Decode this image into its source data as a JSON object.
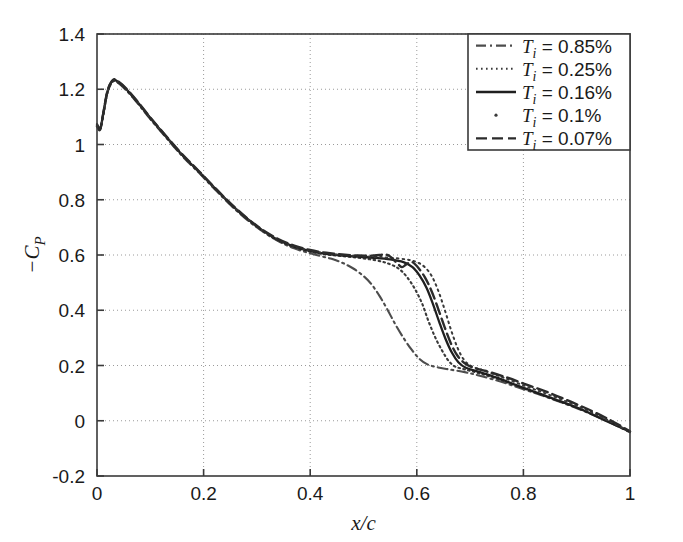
{
  "chart_data": {
    "type": "line",
    "title": "",
    "xlabel": "x/c",
    "ylabel": "-C_P",
    "xlim": [
      0,
      1
    ],
    "ylim": [
      -0.2,
      1.4
    ],
    "xticks": [
      "0",
      "0.2",
      "0.4",
      "0.6",
      "0.8",
      "1"
    ],
    "xtick_values": [
      0,
      0.2,
      0.4,
      0.6,
      0.8,
      1
    ],
    "yticks": [
      "1.4",
      "1.2",
      "1",
      "0.8",
      "0.6",
      "0.4",
      "0.2",
      "0",
      "-0.2"
    ],
    "ytick_values": [
      1.4,
      1.2,
      1.0,
      0.8,
      0.6,
      0.4,
      0.2,
      0,
      -0.2
    ],
    "grid": true,
    "grid_style": "dotted",
    "legend_position": "top-right",
    "series": [
      {
        "name": "Ti = 0.85%",
        "label_var": "T",
        "label_sub": "i",
        "label_value": "= 0.85%",
        "style": "dashdot",
        "color": "#4d4d4d",
        "points": [
          [
            0.0,
            1.075
          ],
          [
            0.006,
            1.06
          ],
          [
            0.012,
            1.11
          ],
          [
            0.02,
            1.19
          ],
          [
            0.03,
            1.228
          ],
          [
            0.04,
            1.222
          ],
          [
            0.055,
            1.196
          ],
          [
            0.075,
            1.152
          ],
          [
            0.1,
            1.092
          ],
          [
            0.13,
            1.024
          ],
          [
            0.16,
            0.958
          ],
          [
            0.19,
            0.9
          ],
          [
            0.22,
            0.84
          ],
          [
            0.25,
            0.782
          ],
          [
            0.28,
            0.73
          ],
          [
            0.31,
            0.686
          ],
          [
            0.34,
            0.65
          ],
          [
            0.37,
            0.624
          ],
          [
            0.4,
            0.606
          ],
          [
            0.42,
            0.596
          ],
          [
            0.44,
            0.586
          ],
          [
            0.46,
            0.572
          ],
          [
            0.48,
            0.552
          ],
          [
            0.5,
            0.524
          ],
          [
            0.515,
            0.494
          ],
          [
            0.53,
            0.452
          ],
          [
            0.545,
            0.402
          ],
          [
            0.56,
            0.348
          ],
          [
            0.575,
            0.3
          ],
          [
            0.59,
            0.258
          ],
          [
            0.605,
            0.224
          ],
          [
            0.62,
            0.204
          ],
          [
            0.64,
            0.193
          ],
          [
            0.66,
            0.186
          ],
          [
            0.69,
            0.176
          ],
          [
            0.72,
            0.162
          ],
          [
            0.76,
            0.14
          ],
          [
            0.8,
            0.114
          ],
          [
            0.84,
            0.088
          ],
          [
            0.88,
            0.06
          ],
          [
            0.92,
            0.03
          ],
          [
            0.96,
            -0.004
          ],
          [
            1.0,
            -0.042
          ]
        ]
      },
      {
        "name": "Ti = 0.25%",
        "label_var": "T",
        "label_sub": "i",
        "label_value": "= 0.25%",
        "style": "dotted",
        "color": "#3a3a3a",
        "points": [
          [
            0.0,
            1.072
          ],
          [
            0.006,
            1.058
          ],
          [
            0.012,
            1.112
          ],
          [
            0.02,
            1.192
          ],
          [
            0.03,
            1.23
          ],
          [
            0.04,
            1.224
          ],
          [
            0.055,
            1.198
          ],
          [
            0.075,
            1.154
          ],
          [
            0.1,
            1.094
          ],
          [
            0.13,
            1.026
          ],
          [
            0.16,
            0.96
          ],
          [
            0.19,
            0.902
          ],
          [
            0.22,
            0.842
          ],
          [
            0.25,
            0.784
          ],
          [
            0.28,
            0.732
          ],
          [
            0.31,
            0.688
          ],
          [
            0.34,
            0.652
          ],
          [
            0.37,
            0.628
          ],
          [
            0.4,
            0.612
          ],
          [
            0.43,
            0.602
          ],
          [
            0.46,
            0.596
          ],
          [
            0.49,
            0.59
          ],
          [
            0.52,
            0.582
          ],
          [
            0.545,
            0.57
          ],
          [
            0.565,
            0.552
          ],
          [
            0.58,
            0.524
          ],
          [
            0.595,
            0.482
          ],
          [
            0.61,
            0.424
          ],
          [
            0.622,
            0.36
          ],
          [
            0.635,
            0.3
          ],
          [
            0.648,
            0.252
          ],
          [
            0.66,
            0.216
          ],
          [
            0.672,
            0.196
          ],
          [
            0.69,
            0.186
          ],
          [
            0.72,
            0.17
          ],
          [
            0.76,
            0.146
          ],
          [
            0.8,
            0.118
          ],
          [
            0.84,
            0.09
          ],
          [
            0.88,
            0.062
          ],
          [
            0.92,
            0.032
          ],
          [
            0.96,
            -0.002
          ],
          [
            1.0,
            -0.04
          ]
        ]
      },
      {
        "name": "Ti = 0.16%",
        "label_var": "T",
        "label_sub": "i",
        "label_value": "= 0.16%",
        "style": "solid",
        "color": "#1f1f1f",
        "points": [
          [
            0.0,
            1.07
          ],
          [
            0.006,
            1.056
          ],
          [
            0.012,
            1.114
          ],
          [
            0.02,
            1.194
          ],
          [
            0.03,
            1.232
          ],
          [
            0.04,
            1.226
          ],
          [
            0.055,
            1.2
          ],
          [
            0.075,
            1.156
          ],
          [
            0.1,
            1.096
          ],
          [
            0.13,
            1.028
          ],
          [
            0.16,
            0.962
          ],
          [
            0.19,
            0.904
          ],
          [
            0.22,
            0.844
          ],
          [
            0.25,
            0.786
          ],
          [
            0.28,
            0.734
          ],
          [
            0.31,
            0.69
          ],
          [
            0.34,
            0.654
          ],
          [
            0.37,
            0.63
          ],
          [
            0.4,
            0.614
          ],
          [
            0.43,
            0.604
          ],
          [
            0.46,
            0.598
          ],
          [
            0.49,
            0.594
          ],
          [
            0.52,
            0.59
          ],
          [
            0.55,
            0.584
          ],
          [
            0.575,
            0.574
          ],
          [
            0.592,
            0.556
          ],
          [
            0.605,
            0.526
          ],
          [
            0.618,
            0.482
          ],
          [
            0.63,
            0.424
          ],
          [
            0.642,
            0.358
          ],
          [
            0.654,
            0.296
          ],
          [
            0.666,
            0.246
          ],
          [
            0.678,
            0.212
          ],
          [
            0.692,
            0.192
          ],
          [
            0.715,
            0.178
          ],
          [
            0.75,
            0.156
          ],
          [
            0.79,
            0.126
          ],
          [
            0.83,
            0.098
          ],
          [
            0.87,
            0.07
          ],
          [
            0.91,
            0.04
          ],
          [
            0.95,
            0.004
          ],
          [
            1.0,
            -0.04
          ]
        ]
      },
      {
        "name": "Ti = 0.1%",
        "label_var": "T",
        "label_sub": "i",
        "label_value": "= 0.1%",
        "style": "dot",
        "color": "#3a3a3a",
        "points": [
          [
            0.0,
            1.068
          ],
          [
            0.006,
            1.056
          ],
          [
            0.012,
            1.114
          ],
          [
            0.02,
            1.194
          ],
          [
            0.03,
            1.232
          ],
          [
            0.04,
            1.226
          ],
          [
            0.055,
            1.2
          ],
          [
            0.075,
            1.156
          ],
          [
            0.1,
            1.096
          ],
          [
            0.13,
            1.028
          ],
          [
            0.16,
            0.962
          ],
          [
            0.19,
            0.904
          ],
          [
            0.22,
            0.844
          ],
          [
            0.25,
            0.786
          ],
          [
            0.28,
            0.734
          ],
          [
            0.31,
            0.69
          ],
          [
            0.34,
            0.656
          ],
          [
            0.37,
            0.632
          ],
          [
            0.4,
            0.616
          ],
          [
            0.43,
            0.606
          ],
          [
            0.46,
            0.6
          ],
          [
            0.49,
            0.596
          ],
          [
            0.52,
            0.594
          ],
          [
            0.55,
            0.59
          ],
          [
            0.58,
            0.584
          ],
          [
            0.6,
            0.574
          ],
          [
            0.615,
            0.556
          ],
          [
            0.628,
            0.524
          ],
          [
            0.64,
            0.472
          ],
          [
            0.652,
            0.404
          ],
          [
            0.664,
            0.33
          ],
          [
            0.676,
            0.266
          ],
          [
            0.688,
            0.222
          ],
          [
            0.702,
            0.198
          ],
          [
            0.725,
            0.182
          ],
          [
            0.76,
            0.158
          ],
          [
            0.8,
            0.128
          ],
          [
            0.84,
            0.1
          ],
          [
            0.88,
            0.07
          ],
          [
            0.92,
            0.038
          ],
          [
            0.96,
            0.0
          ],
          [
            1.0,
            -0.04
          ]
        ]
      },
      {
        "name": "Ti = 0.07%",
        "label_var": "T",
        "label_sub": "i",
        "label_value": "= 0.07%",
        "style": "dashed",
        "color": "#2b2b2b",
        "points": [
          [
            0.0,
            1.066
          ],
          [
            0.006,
            1.054
          ],
          [
            0.012,
            1.116
          ],
          [
            0.02,
            1.196
          ],
          [
            0.03,
            1.234
          ],
          [
            0.04,
            1.228
          ],
          [
            0.055,
            1.202
          ],
          [
            0.075,
            1.158
          ],
          [
            0.1,
            1.098
          ],
          [
            0.13,
            1.03
          ],
          [
            0.16,
            0.964
          ],
          [
            0.19,
            0.906
          ],
          [
            0.22,
            0.846
          ],
          [
            0.25,
            0.788
          ],
          [
            0.28,
            0.736
          ],
          [
            0.31,
            0.692
          ],
          [
            0.34,
            0.658
          ],
          [
            0.37,
            0.634
          ],
          [
            0.4,
            0.618
          ],
          [
            0.43,
            0.608
          ],
          [
            0.46,
            0.602
          ],
          [
            0.49,
            0.598
          ],
          [
            0.52,
            0.598
          ],
          [
            0.545,
            0.6
          ],
          [
            0.562,
            0.572
          ],
          [
            0.572,
            0.556
          ],
          [
            0.58,
            0.566
          ],
          [
            0.59,
            0.575
          ],
          [
            0.6,
            0.56
          ],
          [
            0.615,
            0.52
          ],
          [
            0.628,
            0.468
          ],
          [
            0.64,
            0.406
          ],
          [
            0.652,
            0.34
          ],
          [
            0.664,
            0.28
          ],
          [
            0.676,
            0.236
          ],
          [
            0.69,
            0.208
          ],
          [
            0.706,
            0.192
          ],
          [
            0.73,
            0.18
          ],
          [
            0.77,
            0.156
          ],
          [
            0.81,
            0.128
          ],
          [
            0.85,
            0.1
          ],
          [
            0.89,
            0.068
          ],
          [
            0.93,
            0.034
          ],
          [
            0.965,
            0.0
          ],
          [
            1.0,
            -0.038
          ]
        ]
      }
    ]
  },
  "plot_box": {
    "left": 97,
    "right": 630,
    "top": 34,
    "bottom": 476
  },
  "legend_box": {
    "left": 468,
    "top": 34,
    "width": 162,
    "height": 116
  }
}
